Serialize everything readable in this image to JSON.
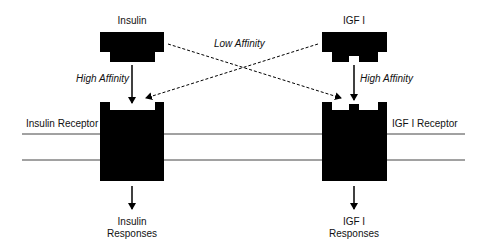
{
  "diagram": {
    "ligands": {
      "insulin": {
        "label": "Insulin"
      },
      "igf": {
        "label": "IGF I"
      }
    },
    "receptors": {
      "insulin": {
        "label": "Insulin Receptor"
      },
      "igf": {
        "label": "IGF I Receptor"
      }
    },
    "affinity": {
      "high_left": "High Affinity",
      "high_right": "High Affinity",
      "low": "Low Affinity"
    },
    "responses": {
      "insulin": {
        "line1": "Insulin",
        "line2": "Responses"
      },
      "igf": {
        "line1": "IGF I",
        "line2": "Responses"
      }
    },
    "colors": {
      "shape": "#000000",
      "line": "#333333"
    }
  }
}
